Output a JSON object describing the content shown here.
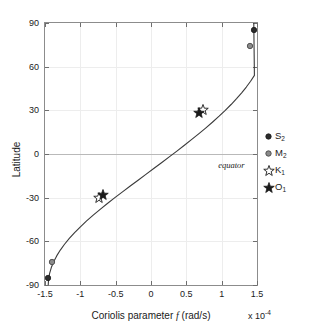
{
  "chart_data": {
    "type": "line",
    "title": "",
    "xlabel": "Coriolis parameter f (rad/s)",
    "xlabel_prefix": "Coriolis parameter ",
    "xlabel_symbol": "f",
    "xlabel_suffix": " (rad/s)",
    "x_exponent_prefix": "x 10",
    "x_exponent_power": "-4",
    "ylabel": "Latitude",
    "xlim": [
      -1.5,
      1.5
    ],
    "ylim": [
      -90,
      90
    ],
    "xticks": [
      -1.5,
      -1,
      -0.5,
      0,
      0.5,
      1,
      1.5
    ],
    "xticklabels": [
      "-1.5",
      "-1",
      "-0.5",
      "0",
      "0.5",
      "1",
      "1.5"
    ],
    "yticks": [
      90,
      60,
      30,
      0,
      -30,
      -60,
      -90
    ],
    "yticklabels": [
      "90",
      "60",
      "30",
      "0",
      "-30",
      "-60",
      "-90"
    ],
    "grid": true,
    "zero_line": true,
    "annotations": [
      {
        "text": "equator",
        "x": 0.95,
        "y": -7.5
      }
    ],
    "curve": {
      "name": "f = 2*Omega*sin(latitude)",
      "color": "#3a3a3a",
      "x": [
        -1.4544,
        -1.4495,
        -1.4348,
        -1.4107,
        -1.3772,
        -1.3346,
        -1.2833,
        -1.2236,
        -1.156,
        -1.081,
        -0.9992,
        -0.9112,
        -0.8177,
        -0.7194,
        -0.6171,
        -0.5114,
        -0.4033,
        -0.2935,
        -0.1829,
        -0.0722,
        0.0385,
        0.1487,
        0.2581,
        0.3663,
        0.4727,
        0.577,
        0.6787,
        0.7773,
        0.8726,
        0.9639,
        1.051,
        1.1334,
        1.2108,
        1.2828,
        1.349,
        1.4093,
        1.4633,
        1.4544
      ],
      "y": [
        -90,
        -86,
        -82,
        -78,
        -74,
        -70,
        -66,
        -62,
        -58,
        -54,
        -50,
        -46,
        -42,
        -38,
        -34,
        -30,
        -26,
        -22,
        -18,
        -14,
        -10,
        -6,
        -2,
        2,
        6,
        10,
        14,
        18,
        22,
        26,
        30,
        34,
        38,
        42,
        46,
        50,
        54,
        90
      ]
    },
    "series": [
      {
        "name": "S2",
        "label_base": "S",
        "label_sub": "2",
        "marker": "filled-circle",
        "color": "#2b2b2b",
        "points": [
          {
            "x": 1.4544,
            "y": 85.0
          },
          {
            "x": -1.4544,
            "y": -85.0
          }
        ]
      },
      {
        "name": "M2",
        "label_base": "M",
        "label_sub": "2",
        "marker": "gray-circle",
        "color": "#8a8a8a",
        "points": [
          {
            "x": 1.4053,
            "y": 74.5
          },
          {
            "x": -1.4053,
            "y": -74.5
          }
        ]
      },
      {
        "name": "K1",
        "label_base": "K",
        "label_sub": "1",
        "marker": "open-star",
        "color": "#2b2b2b",
        "points": [
          {
            "x": 0.7292,
            "y": 30.0
          },
          {
            "x": -0.7292,
            "y": -30.0
          }
        ]
      },
      {
        "name": "O1",
        "label_base": "O",
        "label_sub": "1",
        "marker": "filled-star",
        "color": "#1a1a1a",
        "points": [
          {
            "x": 0.6759,
            "y": 28.0
          },
          {
            "x": -0.6759,
            "y": -28.0
          }
        ]
      }
    ]
  },
  "legend": {
    "position": "right",
    "entries": [
      {
        "marker": "filled-circle",
        "base": "S",
        "sub": "2"
      },
      {
        "marker": "gray-circle",
        "base": "M",
        "sub": "2"
      },
      {
        "marker": "open-star",
        "base": "K",
        "sub": "1"
      },
      {
        "marker": "filled-star",
        "base": "O",
        "sub": "1"
      }
    ]
  },
  "colors": {
    "axis": "#8c8c8c",
    "grid": "#ededed",
    "zero": "#b9b9b9",
    "curve": "#3a3a3a",
    "text": "#1a1a1a",
    "marker_dark": "#2b2b2b",
    "marker_gray": "#8a8a8a"
  }
}
